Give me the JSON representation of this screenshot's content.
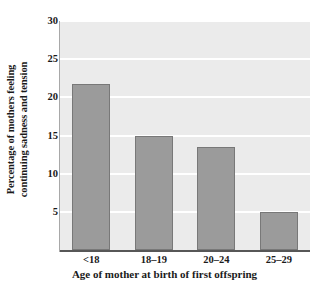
{
  "chart_data": {
    "type": "bar",
    "title": "",
    "categories": [
      "<18",
      "18–19",
      "20–24",
      "25–29"
    ],
    "values": [
      21.8,
      15.0,
      13.5,
      5.0
    ],
    "xlabel": "Age of mother at birth of first offspring",
    "ylabel_line1": "Percentage of mothers feeling",
    "ylabel_line2": "continuing sadness and tension",
    "ylabel": "Percentage of mothers feeling continuing sadness and tension",
    "ylim": [
      0,
      30
    ],
    "yticks": [
      5,
      10,
      15,
      20,
      25,
      30
    ],
    "ytick_labels": [
      "5",
      "10",
      "15",
      "20",
      "25",
      "30"
    ],
    "grid": true,
    "grid_axis": "y",
    "legend": false,
    "legend_position": "none",
    "colors": {
      "bar_fill": "#9b9b9b",
      "bar_edge": "#787878",
      "plot_background": "#ebebeb",
      "gridline": "#ffffff",
      "axis": "#575757",
      "text": "#1a1a1a",
      "page_background": "#ffffff"
    }
  }
}
